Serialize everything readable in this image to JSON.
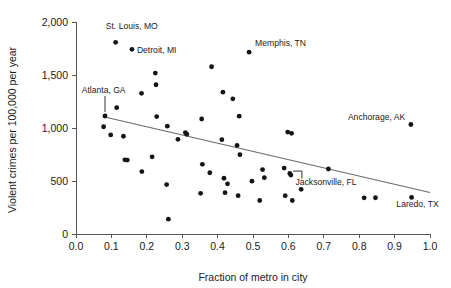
{
  "chart_data": {
    "type": "scatter",
    "title": "",
    "xlabel": "Fraction of metro in city",
    "ylabel": "Violent crimes per 100,000 per year",
    "xlim": [
      0.0,
      1.0
    ],
    "ylim": [
      0,
      2000
    ],
    "xticks": [
      0.0,
      0.1,
      0.2,
      0.3,
      0.4,
      0.5,
      0.6,
      0.7,
      0.8,
      0.9,
      1.0
    ],
    "xtick_labels": [
      "0.0",
      "0.1",
      "0.2",
      "0.3",
      "0.4",
      "0.5",
      "0.6",
      "0.7",
      "0.8",
      "0.9",
      "1.0"
    ],
    "yticks": [
      0,
      500,
      1000,
      1500,
      2000
    ],
    "ytick_labels": [
      "0",
      "500",
      "1,000",
      "1,500",
      "2,000"
    ],
    "grid": false,
    "legend": "none",
    "marker_color": "#141414",
    "marker_radius": 2.4,
    "points": [
      {
        "x": 0.078,
        "y": 1012
      },
      {
        "x": 0.082,
        "y": 1113
      },
      {
        "x": 0.098,
        "y": 935
      },
      {
        "x": 0.112,
        "y": 1808
      },
      {
        "x": 0.115,
        "y": 1192
      },
      {
        "x": 0.134,
        "y": 922
      },
      {
        "x": 0.138,
        "y": 700
      },
      {
        "x": 0.145,
        "y": 697
      },
      {
        "x": 0.158,
        "y": 1742
      },
      {
        "x": 0.185,
        "y": 1327
      },
      {
        "x": 0.186,
        "y": 589
      },
      {
        "x": 0.215,
        "y": 728
      },
      {
        "x": 0.224,
        "y": 1518
      },
      {
        "x": 0.226,
        "y": 1408
      },
      {
        "x": 0.228,
        "y": 1108
      },
      {
        "x": 0.256,
        "y": 466
      },
      {
        "x": 0.258,
        "y": 1017
      },
      {
        "x": 0.261,
        "y": 140
      },
      {
        "x": 0.288,
        "y": 893
      },
      {
        "x": 0.309,
        "y": 957
      },
      {
        "x": 0.313,
        "y": 941
      },
      {
        "x": 0.352,
        "y": 384
      },
      {
        "x": 0.355,
        "y": 1085
      },
      {
        "x": 0.357,
        "y": 657
      },
      {
        "x": 0.378,
        "y": 578
      },
      {
        "x": 0.383,
        "y": 1578
      },
      {
        "x": 0.412,
        "y": 890
      },
      {
        "x": 0.415,
        "y": 1338
      },
      {
        "x": 0.418,
        "y": 526
      },
      {
        "x": 0.421,
        "y": 390
      },
      {
        "x": 0.428,
        "y": 473
      },
      {
        "x": 0.443,
        "y": 1275
      },
      {
        "x": 0.455,
        "y": 836
      },
      {
        "x": 0.458,
        "y": 362
      },
      {
        "x": 0.461,
        "y": 1112
      },
      {
        "x": 0.463,
        "y": 748
      },
      {
        "x": 0.489,
        "y": 1715
      },
      {
        "x": 0.497,
        "y": 498
      },
      {
        "x": 0.519,
        "y": 316
      },
      {
        "x": 0.527,
        "y": 608
      },
      {
        "x": 0.532,
        "y": 531
      },
      {
        "x": 0.588,
        "y": 622
      },
      {
        "x": 0.591,
        "y": 362
      },
      {
        "x": 0.598,
        "y": 962
      },
      {
        "x": 0.604,
        "y": 571
      },
      {
        "x": 0.607,
        "y": 556
      },
      {
        "x": 0.609,
        "y": 950
      },
      {
        "x": 0.611,
        "y": 316
      },
      {
        "x": 0.636,
        "y": 421
      },
      {
        "x": 0.713,
        "y": 613
      },
      {
        "x": 0.814,
        "y": 341
      },
      {
        "x": 0.846,
        "y": 342
      },
      {
        "x": 0.946,
        "y": 1033
      },
      {
        "x": 0.948,
        "y": 345
      }
    ],
    "trend_line": {
      "x_start": 0.075,
      "y_start": 1108,
      "x_end": 1.0,
      "y_end": 392,
      "color": "#6b6b6b"
    },
    "annotations": [
      {
        "label": "St. Louis, MO",
        "x": 0.112,
        "y": 1808,
        "text_x": 0.084,
        "text_y": 1935,
        "anchor": "start",
        "leader": "none"
      },
      {
        "label": "Detroit, MI",
        "x": 0.158,
        "y": 1742,
        "text_x": 0.172,
        "text_y": 1705,
        "anchor": "start",
        "leader": "none"
      },
      {
        "label": "Memphis, TN",
        "x": 0.489,
        "y": 1715,
        "text_x": 0.506,
        "text_y": 1772,
        "anchor": "start",
        "leader": "none"
      },
      {
        "label": "Atlanta, GA",
        "x": 0.082,
        "y": 1113,
        "text_x": 0.016,
        "text_y": 1330,
        "anchor": "start",
        "leader": "vertical"
      },
      {
        "label": "Anchorage, AK",
        "x": 0.946,
        "y": 1033,
        "text_x": 0.93,
        "text_y": 1075,
        "anchor": "end",
        "leader": "none"
      },
      {
        "label": "Jacksonville, FL",
        "x": 0.607,
        "y": 556,
        "text_x": 0.62,
        "text_y": 458,
        "anchor": "start",
        "leader": "bracket"
      },
      {
        "label": "Laredo, TX",
        "x": 0.948,
        "y": 345,
        "text_x": 0.905,
        "text_y": 255,
        "anchor": "start",
        "leader": "none"
      }
    ]
  }
}
